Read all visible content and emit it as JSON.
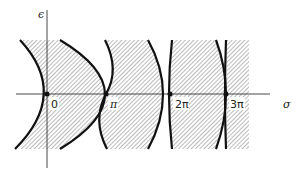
{
  "diagram": {
    "axes": {
      "x_label": "σ",
      "y_label": "ϵ"
    },
    "ticks": [
      {
        "label": "0",
        "x": 47
      },
      {
        "label": "π",
        "x": 106
      },
      {
        "label": "2π",
        "x": 170
      },
      {
        "label": "3π",
        "x": 226
      }
    ],
    "regions": "Hatched stability regions bounded by curves crossing the σ-axis at multiples of π",
    "colors": {
      "line": "#111111",
      "hatch": "#555555",
      "background": "#ffffff"
    }
  }
}
